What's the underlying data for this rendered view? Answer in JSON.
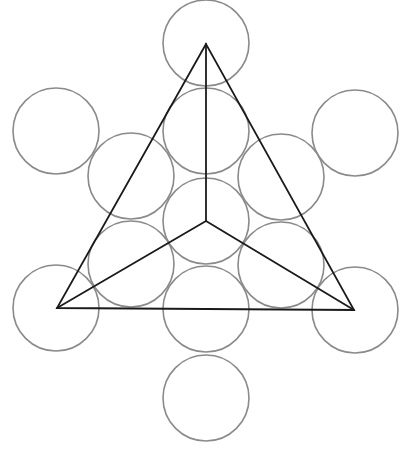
{
  "diagram": {
    "type": "sacred-geometry-circle-grid-with-triangle",
    "width": 402,
    "height": 452,
    "colors": {
      "background": "#ffffff",
      "circle_stroke": "#8a8a8a",
      "line_stroke": "#1a1a1a"
    },
    "circle_radius": 43,
    "circles": [
      {
        "id": "top",
        "cx": 206,
        "cy": 43
      },
      {
        "id": "upper-center",
        "cx": 206,
        "cy": 131
      },
      {
        "id": "center",
        "cx": 206,
        "cy": 221
      },
      {
        "id": "lower-center",
        "cx": 206,
        "cy": 309
      },
      {
        "id": "bottom",
        "cx": 206,
        "cy": 398
      },
      {
        "id": "inner-upper-left",
        "cx": 131,
        "cy": 176
      },
      {
        "id": "inner-upper-right",
        "cx": 281,
        "cy": 177
      },
      {
        "id": "inner-lower-left",
        "cx": 131,
        "cy": 264
      },
      {
        "id": "inner-lower-right",
        "cx": 281,
        "cy": 265
      },
      {
        "id": "outer-upper-left",
        "cx": 56,
        "cy": 131
      },
      {
        "id": "outer-upper-right",
        "cx": 355,
        "cy": 133
      },
      {
        "id": "outer-lower-left",
        "cx": 56,
        "cy": 308
      },
      {
        "id": "outer-lower-right",
        "cx": 355,
        "cy": 310
      }
    ],
    "triangle": {
      "vertices": [
        {
          "id": "apex",
          "x": 206,
          "y": 44
        },
        {
          "id": "left",
          "x": 57,
          "y": 308
        },
        {
          "id": "right",
          "x": 354,
          "y": 310
        }
      ],
      "centroid": {
        "x": 206,
        "y": 221
      }
    }
  }
}
